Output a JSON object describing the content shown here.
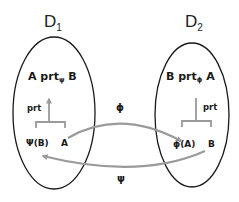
{
  "diagram": {
    "colors": {
      "outline": "#1a1a1a",
      "arrow": "#9a9a9a",
      "background": "#ffffff"
    },
    "domains": [
      {
        "id": "D1",
        "label": "D",
        "subscript": "1",
        "relation": {
          "left": "A prt",
          "subscript": "ψ",
          "right": " B"
        },
        "arrow_label": "prt",
        "nodes": [
          "Ψ(B)",
          "A"
        ]
      },
      {
        "id": "D2",
        "label": "D",
        "subscript": "2",
        "relation": {
          "left": "B prt",
          "subscript": "ϕ",
          "right": " A"
        },
        "arrow_label": "prt",
        "nodes": [
          "ϕ(A)",
          "B"
        ]
      }
    ],
    "mappings": [
      {
        "label": "ϕ",
        "from": "A (D1)",
        "to": "ϕ(A) (D2)"
      },
      {
        "label": "ψ",
        "from": "B (D2)",
        "to": "Ψ(B) (D1)"
      }
    ]
  }
}
